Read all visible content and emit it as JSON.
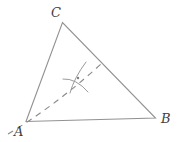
{
  "figure": {
    "type": "geometry-construction",
    "labels": {
      "vertex_a": "A",
      "vertex_b": "B",
      "vertex_c": "C"
    },
    "colors": {
      "triangle_line": "#929292",
      "dashed_line": "#8a8a8a",
      "arc_mark": "#9a9a9a",
      "label_text": "#3f3f3f",
      "background": "#ffffff"
    },
    "geometry": {
      "vertices": {
        "A": {
          "x": 26,
          "y": 121.5
        },
        "B": {
          "x": 155.5,
          "y": 118
        },
        "C": {
          "x": 62.5,
          "y": 22.5
        }
      },
      "dashed_ray": {
        "start": {
          "x": 8,
          "y": 134
        },
        "control": {
          "x": 55,
          "y": 106
        },
        "end": {
          "x": 101,
          "y": 64
        },
        "dash_pattern": "6 5"
      },
      "arc_marks": [
        {
          "path": "M 86 62 Q 74 78 70 93"
        },
        {
          "path": "M 63 79 Q 76 78 88 92"
        }
      ],
      "canvas": {
        "width": 177,
        "height": 142
      }
    }
  }
}
